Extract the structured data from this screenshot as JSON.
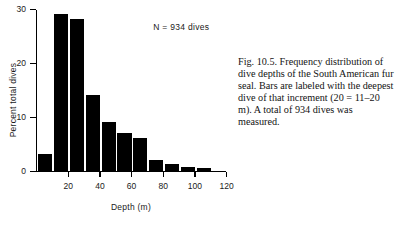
{
  "chart_data": {
    "type": "bar",
    "title": "",
    "xlabel": "Depth (m)",
    "ylabel": "Percent total dives",
    "xlim": [
      0,
      120
    ],
    "ylim": [
      0,
      30
    ],
    "grid": false,
    "legend": "none",
    "bar_color": "#000000",
    "bin_width": 10,
    "categories": [
      "10",
      "20",
      "30",
      "40",
      "50",
      "60",
      "70",
      "80",
      "90",
      "100",
      "110"
    ],
    "values": [
      3,
      29,
      28,
      14,
      9,
      7,
      6,
      2,
      1.3,
      0.7,
      0.4
    ],
    "xticks": [
      20,
      40,
      60,
      80,
      100,
      120
    ],
    "xtick_labels": [
      "20",
      "40",
      "60",
      "80",
      "100",
      "120"
    ],
    "yticks": [
      0,
      10,
      20,
      30
    ],
    "ytick_labels": [
      "0",
      "10",
      "20",
      "30"
    ],
    "annotations": [
      {
        "text": "N  =  934 dives",
        "x": 74,
        "y": 26
      }
    ]
  },
  "annotation": {
    "sample_size": "N  =  934 dives"
  },
  "axes": {
    "x_title": "Depth (m)",
    "y_title": "Percent total dives"
  },
  "caption": {
    "text": "Fig. 10.5. Frequency distribution of dive depths of the South American fur seal. Bars are labeled with the deepest dive of that increment (20 = 11–20 m). A total of 934 dives was measured."
  }
}
